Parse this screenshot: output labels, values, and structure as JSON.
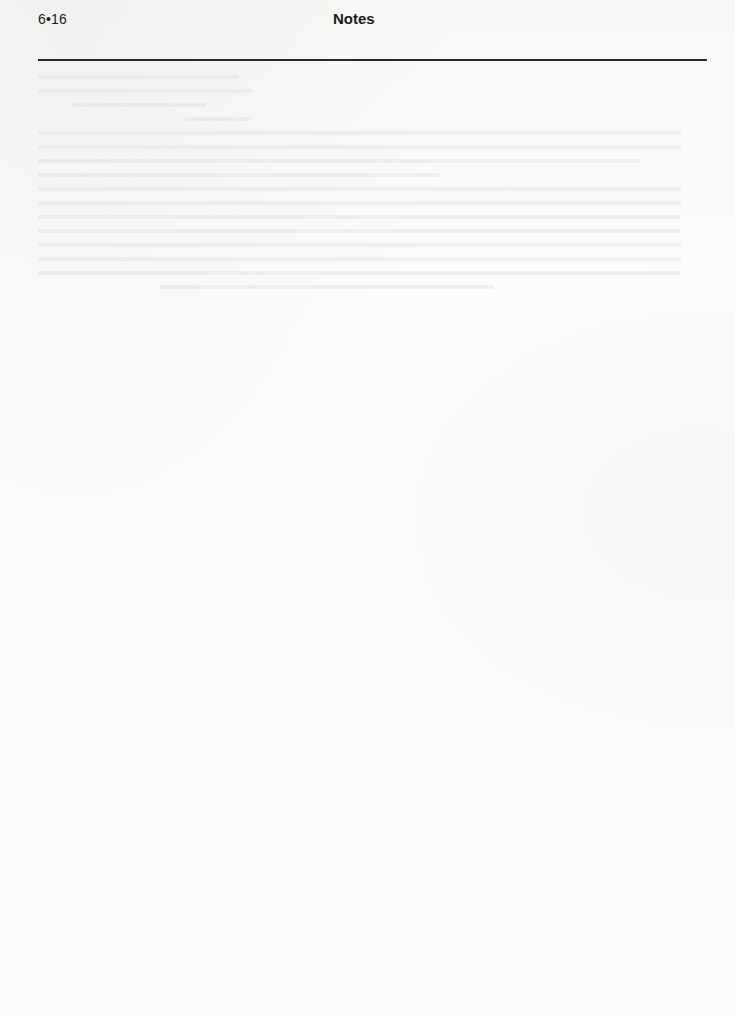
{
  "header": {
    "page_number": "6•16",
    "section_title": "Notes"
  },
  "colors": {
    "paper": "#fbfbfa",
    "text": "#1a1a1a",
    "rule": "#2a2a2a"
  }
}
